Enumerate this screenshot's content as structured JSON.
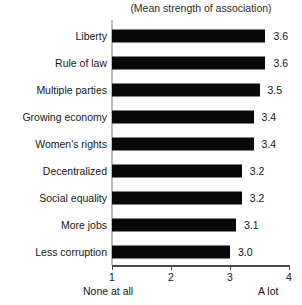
{
  "chart_data": {
    "type": "bar",
    "orientation": "horizontal",
    "title": "(Mean strength of association)",
    "xlabel": "",
    "ylabel": "",
    "xlim": [
      1,
      4
    ],
    "xticks": [
      "1",
      "2",
      "3",
      "4"
    ],
    "grid": false,
    "legend": null,
    "axis_endpoint_labels": {
      "left": "None at all",
      "right": "A lot"
    },
    "bar_color": "#090909",
    "categories": [
      "Liberty",
      "Rule of law",
      "Multiple parties",
      "Growing economy",
      "Women's rights",
      "Decentralized",
      "Social equality",
      "More jobs",
      "Less corruption"
    ],
    "values": [
      3.6,
      3.6,
      3.5,
      3.4,
      3.4,
      3.2,
      3.2,
      3.1,
      3.0
    ],
    "value_labels": [
      "3.6",
      "3.6",
      "3.5",
      "3.4",
      "3.4",
      "3.2",
      "3.2",
      "3.1",
      "3.0"
    ]
  }
}
